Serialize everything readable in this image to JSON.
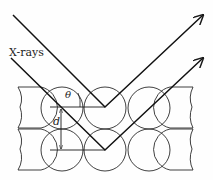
{
  "diagram": {
    "labels": {
      "incident": "X-rays",
      "angle": "θ",
      "spacing": "d"
    },
    "atom_rows": 2,
    "atom_columns": 3,
    "colors": {
      "stroke": "#1a1a1a",
      "background": "#fefefe"
    }
  }
}
